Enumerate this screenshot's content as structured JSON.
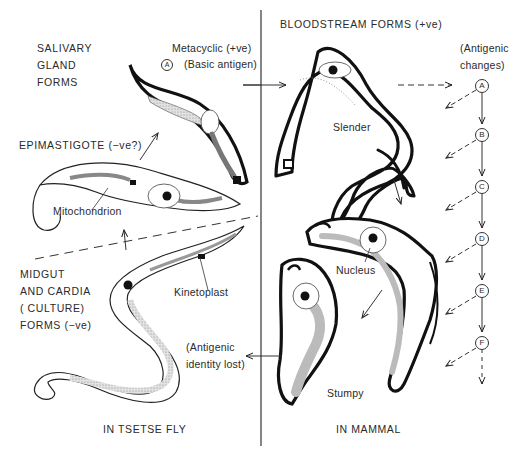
{
  "diagram": {
    "regions": {
      "left": "IN TSETSE FLY",
      "right": "IN MAMMAL"
    },
    "headers": {
      "salivary": [
        "SALIVARY",
        "GLAND",
        "FORMS"
      ],
      "bloodstream": "BLOODSTREAM FORMS (+ve)",
      "metacyclic_line1": "Metacyclic (+ve)",
      "metacyclic_line2": "(Basic antigen)",
      "metacyclic_circle": "A",
      "epimastigote": "EPIMASTIGOTE (−ve?)",
      "midgut": [
        "MIDGUT",
        "AND CARDIA",
        "(  CULTURE)",
        "FORMS (−ve)"
      ],
      "antigenic_changes": [
        "(Antigenic",
        "changes)"
      ],
      "antigenic_lost": [
        "(Antigenic",
        "identity lost)"
      ]
    },
    "structure_labels": {
      "mitochondrion": "Mitochondrion",
      "kinetoplast": "Kinetoplast",
      "nucleus": "Nucleus",
      "slender": "Slender",
      "stumpy": "Stumpy"
    },
    "antigen_sequence": [
      "A",
      "B",
      "C",
      "D",
      "E",
      "F"
    ],
    "forms": [
      {
        "name": "Metacyclic",
        "location": "Salivary gland"
      },
      {
        "name": "Epimastigote",
        "location": "Salivary gland"
      },
      {
        "name": "Midgut procyclic",
        "location": "Midgut and cardia"
      },
      {
        "name": "Slender",
        "location": "Bloodstream"
      },
      {
        "name": "Intermediate",
        "location": "Bloodstream"
      },
      {
        "name": "Stumpy",
        "location": "Bloodstream"
      }
    ],
    "colors": {
      "ink": "#1a1a1a",
      "stipple": "#bdbdbd",
      "background": "#ffffff"
    }
  }
}
